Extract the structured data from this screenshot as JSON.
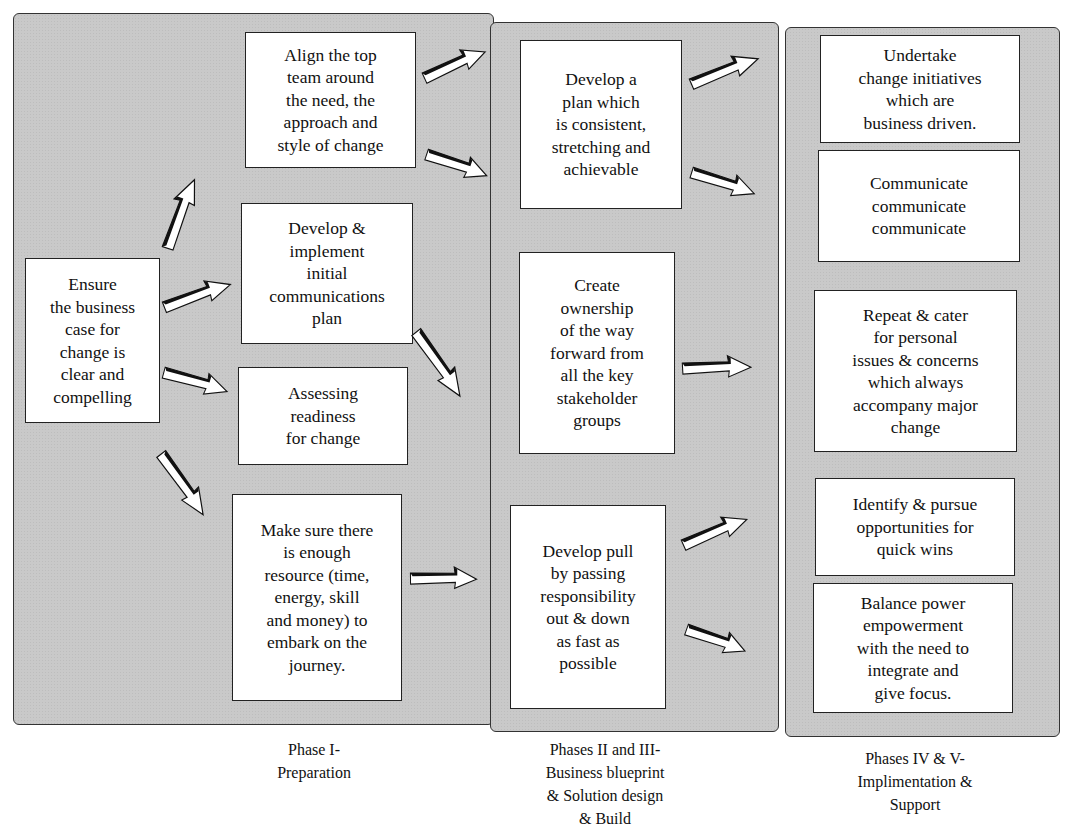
{
  "header_fragment": "g   ng   n     ss",
  "phases": [
    {
      "caption": "Phase I-\nPreparation",
      "boxes": [
        {
          "id": "business-case",
          "text": "Ensure\nthe business\ncase for\nchange is\nclear and\ncompelling"
        },
        {
          "id": "align-top-team",
          "text": "Align the top\nteam around\nthe need, the\napproach and\nstyle of change"
        },
        {
          "id": "communications-plan",
          "text": "Develop &\nimplement\ninitial\ncommunications\nplan"
        },
        {
          "id": "assessing-readiness",
          "text": "Assessing\nreadiness\nfor change"
        },
        {
          "id": "enough-resource",
          "text": "Make sure there\nis enough\nresource (time,\nenergy, skill\nand money) to\nembark on the\njourney."
        }
      ]
    },
    {
      "caption": "Phases II and III-\nBusiness blueprint\n& Solution design\n& Build",
      "boxes": [
        {
          "id": "develop-plan",
          "text": "Develop a\nplan which\nis consistent,\nstretching and\nachievable"
        },
        {
          "id": "create-ownership",
          "text": "Create\nownership\nof the way\nforward from\nall the key\nstakeholder\ngroups"
        },
        {
          "id": "develop-pull",
          "text": "Develop pull\nby passing\nresponsibility\nout & down\nas fast as\npossible"
        }
      ]
    },
    {
      "caption": "Phases IV & V-\nImplimentation &\nSupport",
      "boxes": [
        {
          "id": "undertake-initiatives",
          "text": "Undertake\nchange initiatives\nwhich are\nbusiness driven."
        },
        {
          "id": "communicate",
          "text": "Communicate\ncommunicate\ncommunicate"
        },
        {
          "id": "repeat-cater",
          "text": "Repeat & cater\nfor personal\nissues & concerns\nwhich always\naccompany major\nchange"
        },
        {
          "id": "quick-wins",
          "text": "Identify & pursue\nopportunities for\nquick wins"
        },
        {
          "id": "balance-power",
          "text": "Balance power\nempowerment\nwith the need to\nintegrate and\ngive focus."
        }
      ]
    }
  ],
  "colors": {
    "panel_fill": "#c9c9c9",
    "box_fill": "#ffffff",
    "border": "#222222",
    "arrow_dark": "#111111",
    "arrow_light": "#ffffff"
  }
}
